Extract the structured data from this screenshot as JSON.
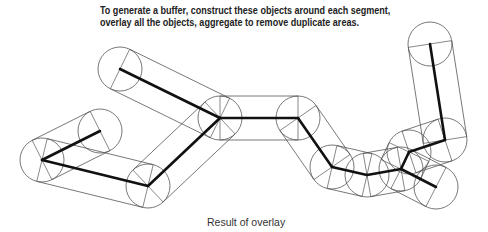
{
  "instruction": {
    "line1": "To generate a buffer, construct these objects around each segment,",
    "line2": "overlay all the objects, aggregate to remove duplicate areas."
  },
  "caption": "Result of overlay",
  "colors": {
    "outline": "#555555",
    "centerline": "#111111",
    "text": "#222222"
  },
  "buffer": {
    "radius": 22,
    "vertices": {
      "A": [
        100,
        131
      ],
      "B": [
        42,
        160
      ],
      "C": [
        148,
        186
      ],
      "D": [
        220,
        118
      ],
      "E": [
        120,
        69
      ],
      "F": [
        298,
        118
      ],
      "G": [
        332,
        167
      ],
      "H": [
        367,
        175
      ],
      "I": [
        401,
        169
      ],
      "J": [
        409,
        152
      ],
      "K": [
        445,
        140
      ],
      "L": [
        430,
        44
      ],
      "M": [
        436,
        187
      ]
    },
    "segments": [
      [
        "A",
        "B"
      ],
      [
        "B",
        "C"
      ],
      [
        "C",
        "D"
      ],
      [
        "E",
        "D"
      ],
      [
        "D",
        "F"
      ],
      [
        "F",
        "G"
      ],
      [
        "G",
        "H"
      ],
      [
        "H",
        "I"
      ],
      [
        "I",
        "J"
      ],
      [
        "J",
        "K"
      ],
      [
        "K",
        "L"
      ],
      [
        "I",
        "M"
      ]
    ]
  }
}
